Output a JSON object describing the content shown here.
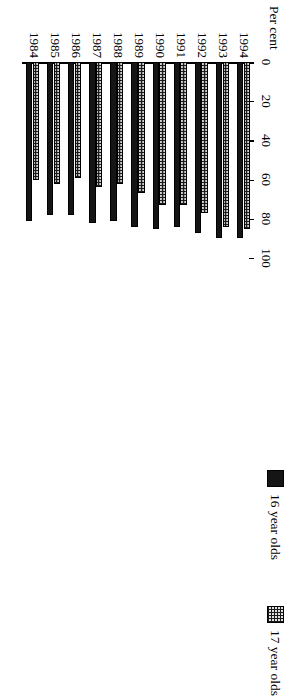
{
  "chart_data": {
    "type": "bar",
    "title": "",
    "xlabel": "",
    "ylabel": "Per cent",
    "ylim": [
      0,
      100
    ],
    "yticks": [
      0,
      20,
      40,
      60,
      80,
      100
    ],
    "grid": false,
    "orientation": "horizontal-rotated",
    "legend_position": "top-left",
    "categories": [
      "1984",
      "1985",
      "1986",
      "1987",
      "1988",
      "1989",
      "1990",
      "1991",
      "1992",
      "1993",
      "1994"
    ],
    "series": [
      {
        "name": "16 year olds",
        "swatch": "solid",
        "color": "#151515",
        "values": [
          81,
          78,
          78,
          82,
          81,
          84,
          85,
          84,
          87,
          90,
          90
        ]
      },
      {
        "name": "17 year olds",
        "swatch": "dotted",
        "color": "#1c1c1c",
        "values": [
          60,
          62,
          59,
          64,
          62,
          67,
          73,
          73,
          77,
          84,
          85
        ]
      }
    ]
  },
  "legend": {
    "items": [
      {
        "label": "16 year olds",
        "swatch": "solid"
      },
      {
        "label": "17 year olds",
        "swatch": "dotted"
      }
    ]
  },
  "axis": {
    "y_title": "Per cent",
    "tick_labels": [
      "0",
      "20",
      "40",
      "60",
      "80",
      "100"
    ]
  }
}
